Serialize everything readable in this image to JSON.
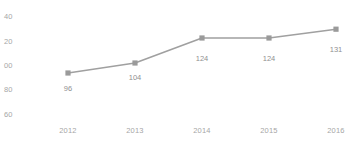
{
  "chart_data": {
    "type": "line",
    "title": "",
    "subtitle": "",
    "xlabel": "",
    "ylabel": "",
    "categories": [
      "2012",
      "2013",
      "2014",
      "2015",
      "2016"
    ],
    "values": [
      96,
      104,
      124,
      124,
      131
    ],
    "data_labels": [
      "96",
      "104",
      "124",
      "124",
      "131"
    ],
    "series": [
      {
        "name": "",
        "values": [
          96,
          104,
          124,
          124,
          131
        ]
      }
    ],
    "ylim": [
      60,
      140
    ],
    "yticks": [
      60,
      80,
      100,
      120,
      140
    ],
    "ytick_labels": [
      "60",
      "80",
      "100",
      "120",
      "140"
    ],
    "ytick_labels_rendered": [
      "60",
      "80",
      "00",
      "20",
      "40"
    ],
    "xtick_labels": [
      "2012",
      "2013",
      "2014",
      "2015",
      "2016"
    ],
    "grid": false,
    "legend": "none",
    "marker": "square",
    "line_color": "#a0a0a0",
    "marker_color": "#9a9a9a",
    "text_color": "#a6a6a6",
    "background": "#ffffff"
  }
}
